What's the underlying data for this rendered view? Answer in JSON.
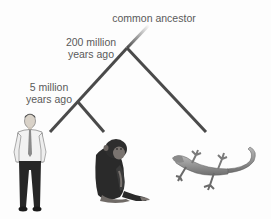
{
  "diagram": {
    "root_label": "common ancestor",
    "nodes": [
      {
        "id": "node-200",
        "label_line1": "200 million",
        "label_line2": "years ago"
      },
      {
        "id": "node-5",
        "label_line1": "5 million",
        "label_line2": "years ago"
      }
    ],
    "leaves": [
      {
        "id": "human",
        "icon": "human-figure-icon"
      },
      {
        "id": "chimpanzee",
        "icon": "chimpanzee-icon"
      },
      {
        "id": "lizard",
        "icon": "lizard-icon"
      }
    ],
    "colors": {
      "branch": "#4a4a4a",
      "text": "#5a5a5a",
      "background": "#fdfdfd"
    }
  }
}
